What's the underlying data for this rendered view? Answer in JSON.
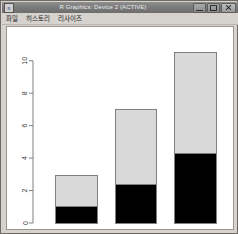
{
  "window": {
    "title": "R Graphics: Device 2 (ACTIVE)",
    "icon": "r-logo-icon",
    "buttons": {
      "minimize": "minimize-button",
      "maximize": "maximize-button",
      "close": "close-button"
    }
  },
  "menu": {
    "items": [
      {
        "label": "파일"
      },
      {
        "label": "히스토리"
      },
      {
        "label": "리사이즈"
      }
    ]
  },
  "chart_data": {
    "type": "bar",
    "stacked": true,
    "title": "",
    "xlabel": "",
    "ylabel": "",
    "categories": [
      "1",
      "2",
      "3"
    ],
    "ylim": [
      0,
      10.6
    ],
    "yticks": [
      0,
      2,
      4,
      6,
      8,
      10
    ],
    "ytick_labels": [
      "0",
      "2",
      "4",
      "6",
      "8",
      "10"
    ],
    "grid": false,
    "legend": "none",
    "axis_color": "#808080",
    "bar_border_color": "#808080",
    "series": [
      {
        "name": "lower",
        "color": "#000000",
        "values": [
          1.0,
          2.4,
          4.3
        ]
      },
      {
        "name": "upper",
        "color": "#d9d9d9",
        "values": [
          1.9,
          4.6,
          6.2
        ]
      }
    ],
    "totals": [
      2.9,
      7.0,
      10.5
    ]
  }
}
